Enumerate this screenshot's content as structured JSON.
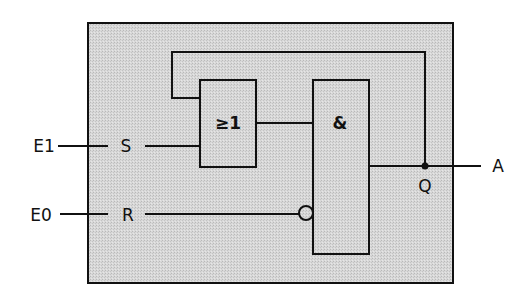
{
  "diagram": {
    "type": "logic-circuit",
    "colors": {
      "enclosure_fill": "#d6d6d6",
      "line": "#111111",
      "background": "#ffffff"
    },
    "inputs": [
      {
        "external": "E1",
        "internal": "S"
      },
      {
        "external": "E0",
        "internal": "R"
      }
    ],
    "gates": [
      {
        "id": "or",
        "symbol": "≥1"
      },
      {
        "id": "and",
        "symbol": "&"
      }
    ],
    "output": {
      "internal": "Q",
      "external": "A"
    }
  }
}
